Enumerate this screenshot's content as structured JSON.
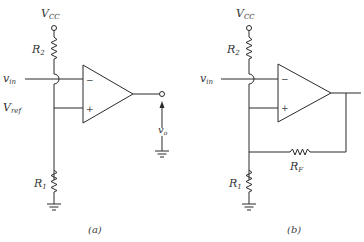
{
  "diagram": {
    "type": "op-amp comparator circuits",
    "panels": [
      {
        "id": "a",
        "caption": "(a)",
        "labels": {
          "supply": "V",
          "supply_sub": "CC",
          "r_top": "R",
          "r_top_sub": "2",
          "input": "v",
          "input_sub": "in",
          "ref": "V",
          "ref_sub": "ref",
          "r_bottom": "R",
          "r_bottom_sub": "1",
          "output": "v",
          "output_sub": "o",
          "minus": "−",
          "plus": "+"
        }
      },
      {
        "id": "b",
        "caption": "(b)",
        "labels": {
          "supply": "V",
          "supply_sub": "CC",
          "r_top": "R",
          "r_top_sub": "2",
          "input": "v",
          "input_sub": "in",
          "r_bottom": "R",
          "r_bottom_sub": "1",
          "r_feedback": "R",
          "r_feedback_sub": "F",
          "minus": "−",
          "plus": "+"
        }
      }
    ]
  }
}
